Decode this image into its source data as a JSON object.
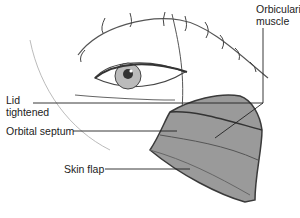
{
  "diagram": {
    "labels": {
      "orbicularis": [
        "Orbicularis",
        "muscle"
      ],
      "lid": [
        "Lid",
        "tightened"
      ],
      "septum": "Orbital septum",
      "skin": "Skin flap"
    },
    "colors": {
      "ink": "#222222",
      "sketch": "#555555",
      "flap": "#3a3a3a"
    }
  }
}
